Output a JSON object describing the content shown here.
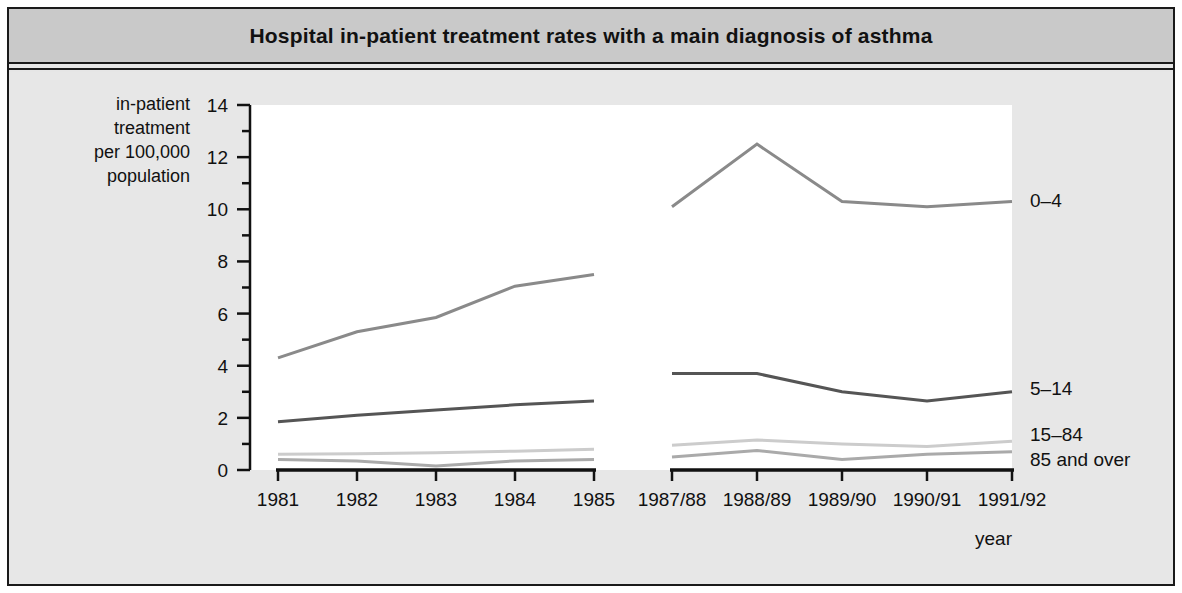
{
  "figure": {
    "title": "Hospital in-patient treatment rates with a main diagnosis of asthma",
    "y_axis_label_lines": [
      "in-patient",
      "treatment",
      "per 100,000",
      "population"
    ],
    "x_axis_label": "year",
    "colors": {
      "frame_border": "#1a1a1a",
      "title_band": "#c9c9c9",
      "body_background": "#e7e7e7",
      "plot_background": "#ffffff",
      "axis": "#111111",
      "series_0_4": "#8a8a8a",
      "series_5_14": "#555555",
      "series_15_84": "#cccccc",
      "series_85_over": "#aaaaaa"
    }
  },
  "chart_data": {
    "type": "line",
    "title": "Hospital in-patient treatment rates with a main diagnosis of asthma",
    "xlabel": "year",
    "ylabel": "in-patient treatment per 100,000 population",
    "ylim": [
      0,
      14
    ],
    "ytick_values": [
      0,
      2,
      4,
      6,
      8,
      10,
      12,
      14
    ],
    "ytick_labels": [
      "0",
      "2",
      "4",
      "6",
      "8",
      "10",
      "12",
      "14"
    ],
    "minor_ticks": true,
    "grid": false,
    "legend_position": "right-of-plot",
    "panels": [
      {
        "name": "calendar-years",
        "categories": [
          "1981",
          "1982",
          "1983",
          "1984",
          "1985"
        ],
        "series": [
          {
            "name": "0–4",
            "values": [
              null,
              null,
              null,
              null,
              null
            ]
          },
          {
            "name": "5–14",
            "values": [
              4.3,
              5.3,
              5.85,
              7.05,
              7.5
            ]
          },
          {
            "name": "15–84",
            "values": [
              1.85,
              2.1,
              2.3,
              2.5,
              2.65
            ]
          },
          {
            "name": "85 and over",
            "values": [
              0.6,
              0.62,
              0.66,
              0.72,
              0.8
            ]
          },
          {
            "name": "lower-band",
            "values": [
              0.4,
              0.35,
              0.15,
              0.35,
              0.4
            ]
          }
        ]
      },
      {
        "name": "financial-years",
        "categories": [
          "1987/88",
          "1988/89",
          "1989/90",
          "1990/91",
          "1991/92"
        ],
        "series": [
          {
            "name": "0–4",
            "values": [
              10.1,
              12.5,
              10.3,
              10.1,
              10.3
            ]
          },
          {
            "name": "5–14",
            "values": [
              3.7,
              3.7,
              3.0,
              2.65,
              3.0
            ]
          },
          {
            "name": "15–84",
            "values": [
              0.95,
              1.15,
              1.0,
              0.9,
              1.1
            ]
          },
          {
            "name": "85 and over",
            "values": [
              0.5,
              0.75,
              0.4,
              0.6,
              0.7
            ]
          }
        ]
      }
    ],
    "series_labels": [
      "0–4",
      "5–14",
      "15–84",
      "85 and over"
    ],
    "note": "Left panel 1981-1985 shows calendar years; right panel 1987/88-1991/92 shows financial years; series for 0-4 only plotted in the financial-year panel in the upper region."
  },
  "legend": {
    "items": [
      {
        "label": "0–4",
        "color": "#8a8a8a"
      },
      {
        "label": "5–14",
        "color": "#555555"
      },
      {
        "label": "15–84",
        "color": "#cccccc"
      },
      {
        "label": "85 and over",
        "color": "#aaaaaa"
      }
    ]
  }
}
